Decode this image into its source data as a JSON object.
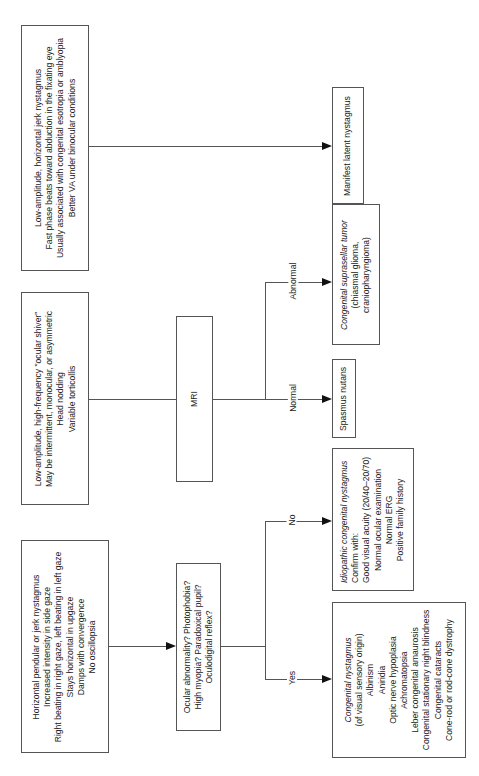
{
  "boxes": {
    "pendular": {
      "lines": [
        "Horizontal pendular or jerk nystagmus",
        "Increased intensity in side gaze",
        "Right beating in right gaze, left beating in left gaze",
        "Stays horizontal in upgaze",
        "Damps with convergence",
        "No oscillopsia"
      ]
    },
    "shiver": {
      "lines": [
        "Low-amplitude, high-frequency \"ocular shiver\"",
        "May be intermittent, monocular, or asymmetric",
        "Head nodding",
        "Variable torticollis"
      ]
    },
    "latent": {
      "lines": [
        "Low-amplitude, horizontal jerk nystagmus",
        "Fast phase beats toward abduction in the fixating eye",
        "Usually associated with congenital esotropia or amblyopia",
        "Better VA under binocular conditions"
      ]
    },
    "question": {
      "lines": [
        "Ocular abnormality? Photophobia?",
        "High myopia? Paradoxical pupil?",
        "Oculodigital reflex?"
      ]
    },
    "mri": {
      "label": "MRI"
    },
    "idiopathic": {
      "title": "Idiopathic congenital nystagmus",
      "subtitle": "Confirm with:",
      "lines": [
        "Good visual acuity (20/40–20/70)",
        "Normal ocular examination",
        "Normal ERG",
        "Positive family history"
      ]
    },
    "congenital": {
      "title": "Congenital nystagmus",
      "subtitle": "(of visual sensory origin)",
      "lines": [
        "Albinism",
        "Aniridia",
        "Optic nerve hypoplasia",
        "Achromatopsia",
        "Leber congenital amaurosis",
        "Congenital stationary night blindness",
        "Congenital cataracts",
        "Cone-rod or rod-cone dystrophy"
      ]
    },
    "spasmus": {
      "label": "Spasmus nutans"
    },
    "tumor": {
      "title": "Congenital suprasellar tumor",
      "lines": [
        "(chiasmal glioma,",
        "craniopharyngioma)"
      ]
    },
    "manifest": {
      "label": "Manifest latent nystagmus"
    }
  },
  "branch_labels": {
    "yes": "Yes",
    "no": "No",
    "normal": "Normal",
    "abnormal": "Abnormal"
  }
}
